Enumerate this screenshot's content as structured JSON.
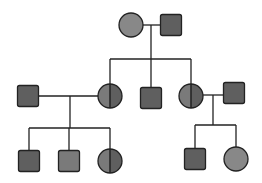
{
  "diagram": {
    "type": "pedigree",
    "colors": {
      "line": "#222222",
      "fill_dark": "#5f5f5f",
      "fill_mid": "#7a7a7a",
      "fill_light": "#888888"
    },
    "generations": [
      {
        "level": 1,
        "individuals": [
          {
            "id": "g1-female",
            "sex": "female",
            "status": "affected"
          },
          {
            "id": "g1-male",
            "sex": "male",
            "status": "affected"
          }
        ]
      },
      {
        "level": 2,
        "individuals": [
          {
            "id": "g2-spouse-left",
            "sex": "male",
            "status": "affected"
          },
          {
            "id": "g2-daughter-1",
            "sex": "female",
            "status": "half-shaded"
          },
          {
            "id": "g2-son",
            "sex": "male",
            "status": "affected"
          },
          {
            "id": "g2-daughter-2",
            "sex": "female",
            "status": "half-shaded"
          },
          {
            "id": "g2-spouse-right",
            "sex": "male",
            "status": "affected"
          }
        ]
      },
      {
        "level": 3,
        "individuals": [
          {
            "id": "g3-son-1",
            "sex": "male",
            "status": "affected"
          },
          {
            "id": "g3-son-2",
            "sex": "male",
            "status": "affected"
          },
          {
            "id": "g3-daughter-1",
            "sex": "female",
            "status": "half-shaded"
          },
          {
            "id": "g3-son-3",
            "sex": "male",
            "status": "affected"
          },
          {
            "id": "g3-daughter-2",
            "sex": "female",
            "status": "affected"
          }
        ]
      }
    ]
  }
}
